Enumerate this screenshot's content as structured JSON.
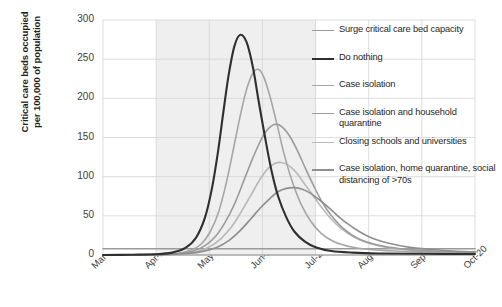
{
  "chart_data": {
    "type": "line",
    "title": "",
    "xlabel": "",
    "ylabel": "Critical care beds occupied per 100,000 of population",
    "ylabel_line1": "Critical care beds occupied",
    "ylabel_line2": "per 100,000 of population",
    "ylim": [
      0,
      300
    ],
    "yticks": [
      0,
      50,
      100,
      150,
      200,
      250,
      300
    ],
    "categories": [
      "Mar-20",
      "Apr-20",
      "May-20",
      "Jun-20",
      "Jul-20",
      "Aug-20",
      "Sep-20",
      "Oct-20"
    ],
    "grid": true,
    "legend_position": "right",
    "shaded_band": {
      "from": "Apr-20",
      "to": "Jul-20"
    },
    "series": [
      {
        "name": "Surge critical care bed capacity",
        "color": "#9a9a9a",
        "width": 1.6,
        "type": "constant",
        "value": 8,
        "points": [
          [
            0,
            8
          ],
          [
            1,
            8
          ],
          [
            2,
            8
          ],
          [
            3,
            8
          ],
          [
            4,
            8
          ],
          [
            5,
            8
          ],
          [
            6,
            8
          ],
          [
            7,
            8
          ]
        ]
      },
      {
        "name": "Do nothing",
        "color": "#2f2f2f",
        "width": 2.1,
        "peak_x": "mid-May-20",
        "peak_value": 281,
        "points": [
          [
            0.0,
            0
          ],
          [
            0.55,
            0.4
          ],
          [
            1.0,
            1
          ],
          [
            1.3,
            3
          ],
          [
            1.55,
            9
          ],
          [
            1.75,
            22
          ],
          [
            1.92,
            48
          ],
          [
            2.05,
            85
          ],
          [
            2.16,
            130
          ],
          [
            2.26,
            180
          ],
          [
            2.36,
            228
          ],
          [
            2.47,
            266
          ],
          [
            2.58,
            281
          ],
          [
            2.7,
            272
          ],
          [
            2.82,
            240
          ],
          [
            2.93,
            196
          ],
          [
            3.05,
            150
          ],
          [
            3.17,
            108
          ],
          [
            3.3,
            74
          ],
          [
            3.45,
            48
          ],
          [
            3.6,
            30
          ],
          [
            3.8,
            17
          ],
          [
            4.0,
            10
          ],
          [
            4.3,
            5
          ],
          [
            4.7,
            3
          ],
          [
            5.2,
            2
          ],
          [
            6.0,
            1.5
          ],
          [
            7.0,
            1.2
          ]
        ]
      },
      {
        "name": "Case isolation",
        "color": "#a6a6a6",
        "width": 1.6,
        "peak_value": 237,
        "points": [
          [
            0.0,
            0
          ],
          [
            0.6,
            0.3
          ],
          [
            1.05,
            0.8
          ],
          [
            1.4,
            2
          ],
          [
            1.65,
            6
          ],
          [
            1.85,
            14
          ],
          [
            2.02,
            30
          ],
          [
            2.18,
            56
          ],
          [
            2.32,
            92
          ],
          [
            2.45,
            134
          ],
          [
            2.58,
            177
          ],
          [
            2.7,
            211
          ],
          [
            2.82,
            232
          ],
          [
            2.92,
            237
          ],
          [
            3.02,
            228
          ],
          [
            3.14,
            203
          ],
          [
            3.27,
            168
          ],
          [
            3.4,
            131
          ],
          [
            3.55,
            96
          ],
          [
            3.72,
            66
          ],
          [
            3.9,
            44
          ],
          [
            4.1,
            28
          ],
          [
            4.35,
            17
          ],
          [
            4.7,
            10
          ],
          [
            5.2,
            6
          ],
          [
            6.0,
            4
          ],
          [
            7.0,
            3
          ]
        ]
      },
      {
        "name": "Case isolation and household quarantine",
        "color": "#9c9c9c",
        "width": 1.6,
        "peak_value": 167,
        "points": [
          [
            0.0,
            0
          ],
          [
            0.65,
            0.3
          ],
          [
            1.1,
            0.8
          ],
          [
            1.45,
            2
          ],
          [
            1.7,
            5
          ],
          [
            1.92,
            12
          ],
          [
            2.12,
            24
          ],
          [
            2.3,
            42
          ],
          [
            2.48,
            66
          ],
          [
            2.65,
            95
          ],
          [
            2.82,
            124
          ],
          [
            2.98,
            148
          ],
          [
            3.12,
            162
          ],
          [
            3.25,
            167
          ],
          [
            3.38,
            163
          ],
          [
            3.52,
            151
          ],
          [
            3.66,
            133
          ],
          [
            3.8,
            112
          ],
          [
            3.96,
            89
          ],
          [
            4.12,
            68
          ],
          [
            4.3,
            50
          ],
          [
            4.52,
            34
          ],
          [
            4.8,
            21
          ],
          [
            5.15,
            13
          ],
          [
            5.6,
            8
          ],
          [
            6.2,
            5
          ],
          [
            7.0,
            3.5
          ]
        ]
      },
      {
        "name": "Closing schools and universities",
        "color": "#b8b8b8",
        "width": 1.6,
        "peak_value": 118,
        "points": [
          [
            0.0,
            0
          ],
          [
            0.7,
            0.3
          ],
          [
            1.15,
            0.8
          ],
          [
            1.52,
            2
          ],
          [
            1.8,
            5
          ],
          [
            2.02,
            11
          ],
          [
            2.22,
            21
          ],
          [
            2.42,
            36
          ],
          [
            2.6,
            55
          ],
          [
            2.78,
            76
          ],
          [
            2.95,
            96
          ],
          [
            3.1,
            110
          ],
          [
            3.24,
            117
          ],
          [
            3.36,
            118
          ],
          [
            3.5,
            114
          ],
          [
            3.64,
            105
          ],
          [
            3.78,
            92
          ],
          [
            3.94,
            77
          ],
          [
            4.1,
            62
          ],
          [
            4.28,
            47
          ],
          [
            4.48,
            34
          ],
          [
            4.72,
            23
          ],
          [
            5.0,
            15
          ],
          [
            5.4,
            9
          ],
          [
            5.9,
            6
          ],
          [
            6.5,
            4
          ],
          [
            7.0,
            3
          ]
        ]
      },
      {
        "name": "Case isolation, home quarantine, social distancing of >70s",
        "color": "#8f8f8f",
        "width": 1.7,
        "peak_value": 86,
        "points": [
          [
            0.0,
            0
          ],
          [
            0.75,
            0.3
          ],
          [
            1.2,
            0.8
          ],
          [
            1.6,
            2
          ],
          [
            1.9,
            5
          ],
          [
            2.15,
            10
          ],
          [
            2.38,
            19
          ],
          [
            2.58,
            31
          ],
          [
            2.78,
            46
          ],
          [
            2.96,
            60
          ],
          [
            3.14,
            72
          ],
          [
            3.3,
            81
          ],
          [
            3.45,
            85
          ],
          [
            3.6,
            86
          ],
          [
            3.75,
            84
          ],
          [
            3.9,
            79
          ],
          [
            4.06,
            71
          ],
          [
            4.22,
            62
          ],
          [
            4.4,
            51
          ],
          [
            4.6,
            40
          ],
          [
            4.82,
            30
          ],
          [
            5.08,
            21
          ],
          [
            5.38,
            15
          ],
          [
            5.75,
            10
          ],
          [
            6.2,
            7
          ],
          [
            6.6,
            5
          ],
          [
            7.0,
            4
          ]
        ]
      }
    ]
  },
  "legend": {
    "entries": [
      {
        "label": "Surge critical care bed capacity"
      },
      {
        "label": "Do nothing"
      },
      {
        "label": "Case isolation"
      },
      {
        "label": "Case isolation and household quarantine"
      },
      {
        "label": "Closing schools and universities"
      },
      {
        "label": "Case isolation, home quarantine, social distancing of >70s"
      }
    ]
  }
}
